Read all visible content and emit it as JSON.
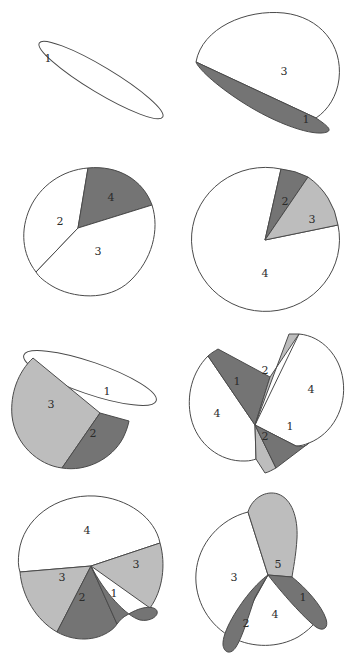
{
  "figure": {
    "background_color": "#ffffff",
    "stroke_color": "#4a4a4a",
    "fills": {
      "white": "#ffffff",
      "light_gray": "#bdbdbd",
      "dark_gray": "#747474"
    },
    "grid": {
      "rows": 4,
      "cols": 2,
      "panel_count": 8
    },
    "panels": [
      {
        "id": "panel-1",
        "position": "row1-left",
        "shape": "thin-ellipse",
        "region_count": 1,
        "regions": [
          {
            "label": "1",
            "fill": "white"
          }
        ]
      },
      {
        "id": "panel-2",
        "position": "row1-right",
        "shape": "flattened-ellipse-two-regions",
        "region_count": 2,
        "regions": [
          {
            "label": "3",
            "fill": "white"
          },
          {
            "label": "1",
            "fill": "dark_gray"
          }
        ]
      },
      {
        "id": "panel-3",
        "position": "row2-left",
        "shape": "tilted-ellipse-three-regions",
        "region_count": 3,
        "regions": [
          {
            "label": "2",
            "fill": "white"
          },
          {
            "label": "4",
            "fill": "dark_gray"
          },
          {
            "label": "3",
            "fill": "white"
          }
        ]
      },
      {
        "id": "panel-4",
        "position": "row2-right",
        "shape": "ellipse-three-wedges",
        "region_count": 3,
        "regions": [
          {
            "label": "2",
            "fill": "dark_gray"
          },
          {
            "label": "3",
            "fill": "light_gray"
          },
          {
            "label": "4",
            "fill": "white"
          }
        ]
      },
      {
        "id": "panel-5",
        "position": "row3-left",
        "shape": "ellipse-three-regions-overlap",
        "region_count": 3,
        "regions": [
          {
            "label": "3",
            "fill": "light_gray"
          },
          {
            "label": "2",
            "fill": "dark_gray"
          },
          {
            "label": "1",
            "fill": "white"
          }
        ]
      },
      {
        "id": "panel-6",
        "position": "row3-right",
        "shape": "self-intersecting-bowtie",
        "region_count": 6,
        "regions": [
          {
            "label": "1",
            "fill": "dark_gray"
          },
          {
            "label": "2",
            "fill": "light_gray"
          },
          {
            "label": "4",
            "fill": "white"
          },
          {
            "label": "4",
            "fill": "white"
          },
          {
            "label": "2",
            "fill": "light_gray"
          },
          {
            "label": "1",
            "fill": "dark_gray"
          }
        ]
      },
      {
        "id": "panel-7",
        "position": "row4-left",
        "shape": "ellipse-five-regions",
        "region_count": 5,
        "regions": [
          {
            "label": "4",
            "fill": "white"
          },
          {
            "label": "3",
            "fill": "light_gray"
          },
          {
            "label": "3",
            "fill": "light_gray"
          },
          {
            "label": "2",
            "fill": "dark_gray"
          },
          {
            "label": "1",
            "fill": "dark_gray"
          }
        ]
      },
      {
        "id": "panel-8",
        "position": "row4-right",
        "shape": "ellipse-five-regions-petal",
        "region_count": 5,
        "regions": [
          {
            "label": "5",
            "fill": "light_gray"
          },
          {
            "label": "3",
            "fill": "white"
          },
          {
            "label": "1",
            "fill": "dark_gray"
          },
          {
            "label": "2",
            "fill": "dark_gray"
          },
          {
            "label": "4",
            "fill": "white"
          }
        ]
      }
    ]
  }
}
